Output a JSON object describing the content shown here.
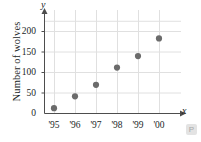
{
  "chart_data": {
    "type": "scatter",
    "title": "",
    "xlabel": "x",
    "ylabel": "Number of wolves",
    "axis_letters": {
      "x": "x",
      "y": "y"
    },
    "categories": [
      "'95",
      "'96",
      "'97",
      "'98",
      "'99",
      "'00"
    ],
    "values": [
      13,
      42,
      70,
      112,
      140,
      183
    ],
    "points": [
      {
        "x": "'95",
        "y": 13
      },
      {
        "x": "'96",
        "y": 42
      },
      {
        "x": "'97",
        "y": 70
      },
      {
        "x": "'98",
        "y": 112
      },
      {
        "x": "'99",
        "y": 140
      },
      {
        "x": "'00",
        "y": 183
      }
    ],
    "xticklabels": [
      "'95",
      "'96",
      "'97",
      "'98",
      "'99",
      "'00"
    ],
    "yticklabels": [
      "0",
      "50",
      "100",
      "150",
      "200"
    ],
    "ytickvalues": [
      0,
      50,
      100,
      150,
      200
    ],
    "ylim": [
      0,
      230
    ],
    "xlim": [
      0,
      7
    ],
    "grid": true,
    "legend": null,
    "marker_color": "#6b6b6b",
    "grid_color": "#e0e0e0",
    "axis_color": "#4d4d4d",
    "text_color": "#221f1f"
  },
  "watermark": {
    "glyph": "P"
  }
}
